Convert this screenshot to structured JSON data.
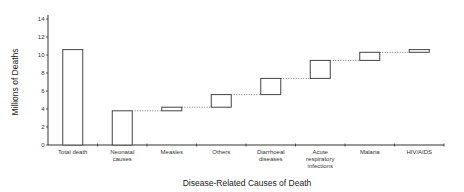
{
  "chart_data": {
    "type": "bar",
    "subtype": "waterfall",
    "title": "",
    "xlabel": "Disease-Related Causes of Death",
    "ylabel": "Millions of Deaths",
    "ylim": [
      0,
      14
    ],
    "yticks": [
      0,
      2,
      4,
      6,
      8,
      10,
      12,
      14
    ],
    "grid": false,
    "legend": null,
    "categories": [
      {
        "label": [
          "Total death"
        ]
      },
      {
        "label": [
          "Neonatal",
          "causes"
        ]
      },
      {
        "label": [
          "Measles"
        ]
      },
      {
        "label": [
          "Others"
        ]
      },
      {
        "label": [
          "Diarrhoeal",
          "diseases"
        ]
      },
      {
        "label": [
          "Acute",
          "respiratory",
          "infections"
        ]
      },
      {
        "label": [
          "Malaria"
        ]
      },
      {
        "label": [
          "HIV/AIDS"
        ]
      }
    ],
    "bars": [
      {
        "name": "Total death",
        "start": 0,
        "end": 10.6
      },
      {
        "name": "Neonatal causes",
        "start": 0,
        "end": 3.8
      },
      {
        "name": "Measles",
        "start": 3.8,
        "end": 4.2
      },
      {
        "name": "Others",
        "start": 4.2,
        "end": 5.6
      },
      {
        "name": "Diarrhoeal diseases",
        "start": 5.6,
        "end": 7.4
      },
      {
        "name": "Acute respiratory infections",
        "start": 7.4,
        "end": 9.4
      },
      {
        "name": "Malaria",
        "start": 9.4,
        "end": 10.3
      },
      {
        "name": "HIV/AIDS",
        "start": 10.3,
        "end": 10.6
      }
    ],
    "connectors": "dotted lines linking top of each floating bar to the next",
    "colors": {
      "bar_fill": "#ffffff",
      "bar_stroke": "#444444",
      "axis": "#333333",
      "connector": "#555555"
    }
  }
}
